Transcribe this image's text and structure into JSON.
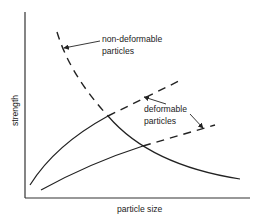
{
  "diagram": {
    "axes": {
      "x_label": "particle size",
      "y_label": "strength"
    },
    "annotations": {
      "non_deformable": {
        "line1": "non-deformable",
        "line2": "particles"
      },
      "deformable": {
        "line1": "deformable",
        "line2": "particles"
      }
    },
    "curves": [
      {
        "name": "non-deformable particles",
        "style": "dashed then solid",
        "description": "decreasing strength with particle size"
      },
      {
        "name": "deformable particles (upper)",
        "style": "solid then dashed",
        "description": "increasing strength with particle size"
      },
      {
        "name": "deformable particles (lower)",
        "style": "solid then dashed",
        "description": "increasing strength with particle size"
      }
    ],
    "colors": {
      "line": "#222222",
      "background": "#ffffff"
    }
  }
}
